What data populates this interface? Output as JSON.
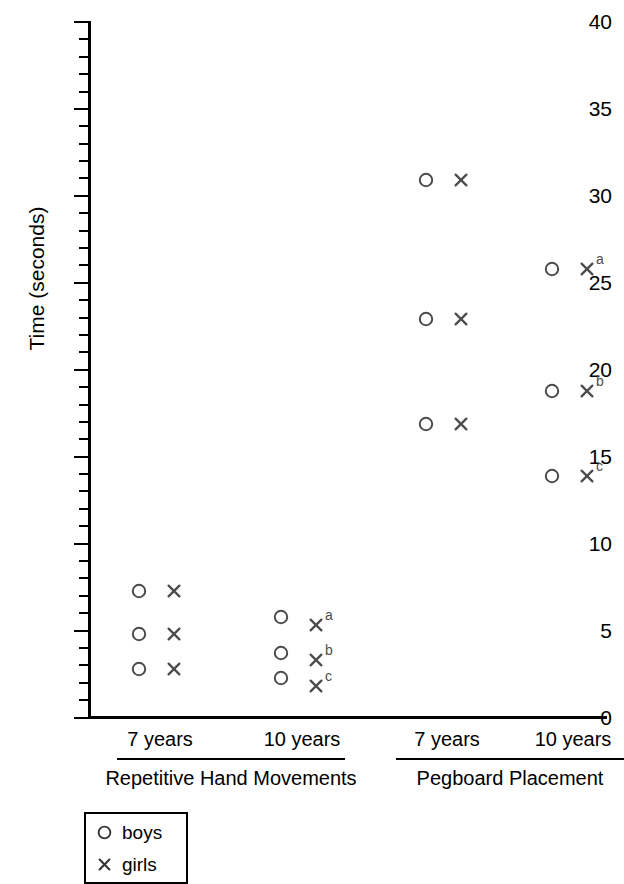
{
  "chart_data": {
    "type": "scatter",
    "title": "",
    "xlabel": "",
    "ylabel": "Time (seconds)",
    "ylim": [
      0,
      40
    ],
    "ytick_major": [
      0,
      5,
      10,
      15,
      20,
      25,
      30,
      35,
      40
    ],
    "ytick_minor_step": 1,
    "grid": false,
    "legend_position": "bottom-left",
    "legend": [
      {
        "key": "boys",
        "label": "boys",
        "marker": "circle"
      },
      {
        "key": "girls",
        "label": "girls",
        "marker": "cross"
      }
    ],
    "tasks": [
      {
        "name": "Repetitive Hand Movements",
        "age_groups": [
          {
            "age": "7 years",
            "points": [
              {
                "series": "boys",
                "value": 7.3,
                "annotation": ""
              },
              {
                "series": "girls",
                "value": 7.3,
                "annotation": ""
              },
              {
                "series": "boys",
                "value": 4.8,
                "annotation": ""
              },
              {
                "series": "girls",
                "value": 4.8,
                "annotation": ""
              },
              {
                "series": "boys",
                "value": 2.8,
                "annotation": ""
              },
              {
                "series": "girls",
                "value": 2.8,
                "annotation": ""
              }
            ]
          },
          {
            "age": "10 years",
            "points": [
              {
                "series": "boys",
                "value": 5.8,
                "annotation": ""
              },
              {
                "series": "girls",
                "value": 5.3,
                "annotation": "a"
              },
              {
                "series": "boys",
                "value": 3.7,
                "annotation": ""
              },
              {
                "series": "girls",
                "value": 3.3,
                "annotation": "b"
              },
              {
                "series": "boys",
                "value": 2.3,
                "annotation": ""
              },
              {
                "series": "girls",
                "value": 1.8,
                "annotation": "c"
              }
            ]
          }
        ]
      },
      {
        "name": "Pegboard Placement",
        "age_groups": [
          {
            "age": "7 years",
            "points": [
              {
                "series": "boys",
                "value": 30.9,
                "annotation": ""
              },
              {
                "series": "girls",
                "value": 30.9,
                "annotation": ""
              },
              {
                "series": "boys",
                "value": 22.9,
                "annotation": ""
              },
              {
                "series": "girls",
                "value": 22.9,
                "annotation": ""
              },
              {
                "series": "boys",
                "value": 16.9,
                "annotation": ""
              },
              {
                "series": "girls",
                "value": 16.9,
                "annotation": ""
              }
            ]
          },
          {
            "age": "10 years",
            "points": [
              {
                "series": "boys",
                "value": 25.8,
                "annotation": ""
              },
              {
                "series": "girls",
                "value": 25.8,
                "annotation": "a"
              },
              {
                "series": "boys",
                "value": 18.8,
                "annotation": ""
              },
              {
                "series": "girls",
                "value": 18.8,
                "annotation": "b"
              },
              {
                "series": "boys",
                "value": 13.9,
                "annotation": ""
              },
              {
                "series": "girls",
                "value": 13.9,
                "annotation": "c"
              }
            ]
          }
        ]
      }
    ]
  },
  "axis": {
    "y_title": "Time (seconds)",
    "y_labels": [
      "40",
      "35",
      "30",
      "25",
      "20",
      "15",
      "10",
      "5",
      "0"
    ]
  },
  "x_axis": {
    "groups": [
      {
        "age": "7 years",
        "task": "Repetitive Hand Movements"
      },
      {
        "age": "10 years",
        "task": "Repetitive Hand Movements"
      },
      {
        "age": "7 years",
        "task": "Pegboard Placement"
      },
      {
        "age": "10 years",
        "task": "Pegboard Placement"
      }
    ],
    "tasks": [
      "Repetitive Hand Movements",
      "Pegboard Placement"
    ]
  },
  "legend": {
    "boys_label": "boys",
    "girls_label": "girls"
  },
  "colors": {
    "marker": "#4c4c4c",
    "axis": "#000000",
    "text": "#000000"
  }
}
